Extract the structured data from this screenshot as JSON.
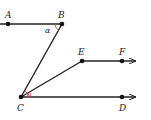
{
  "diagram": {
    "type": "geometry",
    "points": [
      {
        "id": "A",
        "label": "A",
        "x": 8,
        "y": 24
      },
      {
        "id": "B",
        "label": "B",
        "x": 62,
        "y": 24
      },
      {
        "id": "C",
        "label": "C",
        "x": 21,
        "y": 97
      },
      {
        "id": "D",
        "label": "D",
        "x": 122,
        "y": 97
      },
      {
        "id": "E",
        "label": "E",
        "x": 82,
        "y": 61
      },
      {
        "id": "F",
        "label": "F",
        "x": 122,
        "y": 61
      }
    ],
    "angle_label": "α",
    "colors": {
      "line": "#222222",
      "angle_arc": "#d04050"
    }
  }
}
